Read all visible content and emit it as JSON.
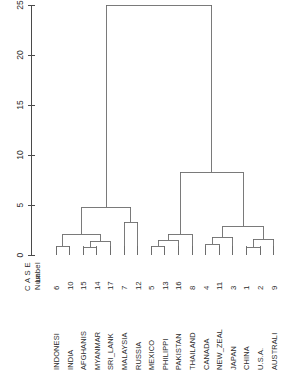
{
  "chart_data": {
    "type": "dendrogram",
    "title": "",
    "subtitle": "",
    "xlabel": "",
    "ylabel": "Rescaled Distance Cluster Combine",
    "orientation": "vertical",
    "grid": false,
    "legend_position": "none",
    "axis": {
      "ticks": [
        0,
        5,
        10,
        15,
        20,
        25
      ],
      "tick_labels": [
        "0",
        "5",
        "10",
        "15",
        "20",
        "25"
      ],
      "range": [
        0,
        25
      ]
    },
    "header": {
      "case_label": "C A S E",
      "label_row": "Label",
      "num_row": "Num"
    },
    "leaves": [
      {
        "order": 1,
        "label": "INDONESI",
        "num": "6"
      },
      {
        "order": 2,
        "label": "INDIA",
        "num": "10"
      },
      {
        "order": 3,
        "label": "AFGHANIS",
        "num": "15"
      },
      {
        "order": 4,
        "label": "MYANMAR",
        "num": "14"
      },
      {
        "order": 5,
        "label": "SRI_LANK",
        "num": "17"
      },
      {
        "order": 6,
        "label": "MALAYSIA",
        "num": "7"
      },
      {
        "order": 7,
        "label": "RUSSIA",
        "num": "12"
      },
      {
        "order": 8,
        "label": "MEXICO",
        "num": "5"
      },
      {
        "order": 9,
        "label": "PHILIPPI",
        "num": "13"
      },
      {
        "order": 10,
        "label": "PAKISTAN",
        "num": "16"
      },
      {
        "order": 11,
        "label": "THAILAND",
        "num": "8"
      },
      {
        "order": 12,
        "label": "CANADA",
        "num": "4"
      },
      {
        "order": 13,
        "label": "NEW_ZEAL",
        "num": "11"
      },
      {
        "order": 14,
        "label": "JAPAN",
        "num": "3"
      },
      {
        "order": 15,
        "label": "CHINA",
        "num": "1"
      },
      {
        "order": 16,
        "label": "U.S.A.",
        "num": "2"
      },
      {
        "order": 17,
        "label": "AUSTRALI",
        "num": "9"
      }
    ],
    "merges": [
      {
        "id": "m1",
        "left": "leaf:1",
        "right": "leaf:2",
        "height": 0.9
      },
      {
        "id": "m2",
        "left": "leaf:3",
        "right": "leaf:4",
        "height": 0.8
      },
      {
        "id": "m3",
        "left": "m2",
        "right": "leaf:5",
        "height": 1.4
      },
      {
        "id": "m4",
        "left": "m1",
        "right": "m3",
        "height": 2.1
      },
      {
        "id": "m5",
        "left": "leaf:6",
        "right": "leaf:7",
        "height": 3.3
      },
      {
        "id": "m6",
        "left": "m4",
        "right": "m5",
        "height": 4.8
      },
      {
        "id": "m7",
        "left": "leaf:8",
        "right": "leaf:9",
        "height": 0.9
      },
      {
        "id": "m8",
        "left": "m7",
        "right": "leaf:10",
        "height": 1.5
      },
      {
        "id": "m9",
        "left": "m8",
        "right": "leaf:11",
        "height": 2.1
      },
      {
        "id": "m10",
        "left": "leaf:12",
        "right": "leaf:13",
        "height": 1.1
      },
      {
        "id": "m11",
        "left": "m10",
        "right": "leaf:14",
        "height": 1.8
      },
      {
        "id": "m12",
        "left": "leaf:15",
        "right": "leaf:16",
        "height": 0.8
      },
      {
        "id": "m13",
        "left": "m12",
        "right": "leaf:17",
        "height": 1.6
      },
      {
        "id": "m14",
        "left": "m11",
        "right": "m13",
        "height": 2.9
      },
      {
        "id": "m15",
        "left": "m9",
        "right": "m14",
        "height": 8.3
      },
      {
        "id": "m16",
        "left": "m6",
        "right": "m15",
        "height": 25.0
      }
    ],
    "clusters": [
      {
        "name": "cluster-left",
        "members": [
          1,
          2,
          3,
          4,
          5,
          6,
          7
        ]
      },
      {
        "name": "cluster-right",
        "members": [
          8,
          9,
          10,
          11,
          12,
          13,
          14,
          15,
          16,
          17
        ]
      }
    ],
    "colors": {
      "line": "#6b6b6b",
      "axis": "#4a4a4a",
      "text": "#2b2b2b",
      "background": "#ffffff"
    }
  }
}
